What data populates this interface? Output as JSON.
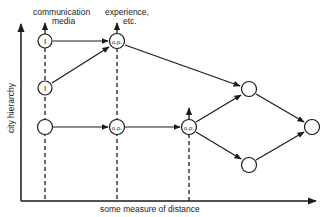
{
  "diagram": {
    "axes": {
      "y_label": "city hierarchy",
      "x_label": "some measure of distance"
    },
    "column_labels": {
      "communication_media_line1": "communication",
      "communication_media_line2": "media",
      "experience_line1": "experience,",
      "experience_line2": "etc."
    },
    "nodes": [
      {
        "id": "n1",
        "label": "I",
        "x": 45,
        "y": 41
      },
      {
        "id": "n2",
        "label": "I",
        "x": 45,
        "y": 88
      },
      {
        "id": "n3",
        "label": "",
        "x": 45,
        "y": 127
      },
      {
        "id": "n4",
        "label": "o.p.",
        "x": 117,
        "y": 41
      },
      {
        "id": "n5",
        "label": "o.p.",
        "x": 117,
        "y": 127
      },
      {
        "id": "n6",
        "label": "o.p.",
        "x": 189,
        "y": 127
      },
      {
        "id": "n7",
        "label": "",
        "x": 249,
        "y": 89
      },
      {
        "id": "n8",
        "label": "",
        "x": 249,
        "y": 165
      },
      {
        "id": "n9",
        "label": "",
        "x": 312,
        "y": 127
      }
    ],
    "edges": [
      {
        "from": "n1",
        "to": "n4"
      },
      {
        "from": "n2",
        "to": "n4"
      },
      {
        "from": "n3",
        "to": "n5"
      },
      {
        "from": "n5",
        "to": "n6"
      },
      {
        "from": "n4",
        "to": "n7"
      },
      {
        "from": "n6",
        "to": "n7"
      },
      {
        "from": "n6",
        "to": "n8"
      },
      {
        "from": "n7",
        "to": "n9"
      },
      {
        "from": "n8",
        "to": "n9"
      }
    ],
    "node_labels": {
      "n1": "I",
      "n2": "I",
      "n4": "o.p.",
      "n5": "o.p.",
      "n6": "o.p."
    }
  }
}
